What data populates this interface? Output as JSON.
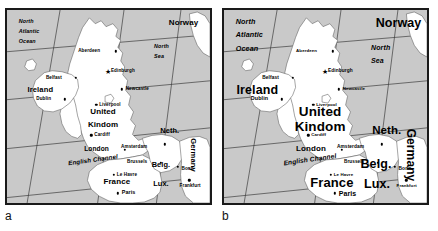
{
  "figure": {
    "panels": [
      {
        "id": "a",
        "caption": "a",
        "label_scale": "small",
        "oceans": [
          {
            "name": "north-atlantic-ocean",
            "text_lines": [
              "North",
              "Atlantic",
              "Ocean"
            ],
            "x": 12,
            "y": 12,
            "size": 5.4
          },
          {
            "name": "north-sea",
            "text_lines": [
              "North",
              "Sea"
            ],
            "x": 150,
            "y": 38,
            "size": 5.4
          }
        ],
        "countries": [
          {
            "name": "ireland",
            "label": "Ireland",
            "x": 34,
            "y": 82,
            "size": 7.6
          },
          {
            "name": "united-kingdom",
            "label": "United",
            "x": 98,
            "y": 104,
            "size": 8.0
          },
          {
            "name": "united-kingdom-2",
            "label": "Kindom",
            "x": 98,
            "y": 117,
            "size": 8.0
          },
          {
            "name": "norway",
            "label": "Norway",
            "x": 180,
            "y": 13,
            "size": 8.0
          },
          {
            "name": "netherlands",
            "label": "Neth.",
            "x": 166,
            "y": 124,
            "size": 7.4
          },
          {
            "name": "belgium",
            "label": "Belg.",
            "x": 157,
            "y": 158,
            "size": 7.4
          },
          {
            "name": "luxembourg",
            "label": "Lux.",
            "x": 157,
            "y": 178,
            "size": 7.4
          },
          {
            "name": "france",
            "label": "France",
            "x": 112,
            "y": 176,
            "size": 8.0
          },
          {
            "name": "germany",
            "label": "Germany",
            "x": 190,
            "y": 148,
            "size": 7.6,
            "vertical": true
          }
        ],
        "seas": [
          {
            "name": "english-channel",
            "label": "English Channel",
            "x": 88,
            "y": 153,
            "size": 6.2,
            "rotate": -8
          }
        ],
        "cities": [
          {
            "name": "aberdeen",
            "label": "Aberdeen",
            "lx": 95,
            "ly": 42,
            "dx": 111,
            "dy": 42,
            "size": 4.6,
            "anchor": "right"
          },
          {
            "name": "edinburgh",
            "label": "Edinburgh",
            "lx": 106,
            "ly": 62,
            "dx": 103,
            "dy": 62,
            "size": 4.6,
            "anchor": "left",
            "marker": "star"
          },
          {
            "name": "newcastle",
            "label": "Newcastle",
            "lx": 121,
            "ly": 81,
            "dx": 117,
            "dy": 81,
            "size": 4.6,
            "anchor": "left"
          },
          {
            "name": "belfast",
            "label": "Belfast",
            "lx": 56,
            "ly": 69,
            "dx": 70,
            "dy": 69,
            "size": 4.6,
            "anchor": "right"
          },
          {
            "name": "dublin",
            "label": "Dublin",
            "lx": 45,
            "ly": 91,
            "dx": 59,
            "dy": 91,
            "size": 4.6,
            "anchor": "right"
          },
          {
            "name": "liverpool",
            "label": "Liverpool",
            "lx": 94,
            "ly": 97,
            "dx": 91,
            "dy": 97,
            "size": 4.6,
            "anchor": "left"
          },
          {
            "name": "cardiff",
            "label": "Cardiff",
            "lx": 89,
            "ly": 128,
            "dx": 86,
            "dy": 128,
            "size": 4.6,
            "anchor": "left"
          },
          {
            "name": "london",
            "label": "London",
            "lx": 104,
            "ly": 142,
            "dx": 120,
            "dy": 143,
            "size": 6.6,
            "anchor": "right"
          },
          {
            "name": "amsterdam",
            "label": "Amsterdam",
            "lx": 143,
            "ly": 140,
            "dx": 161,
            "dy": 137,
            "size": 4.6,
            "anchor": "right"
          },
          {
            "name": "brussels",
            "label": "Brussels",
            "lx": 143,
            "ly": 155,
            "dx": 157,
            "dy": 156,
            "size": 4.6,
            "anchor": "right"
          },
          {
            "name": "le-havre",
            "label": "Le Havre",
            "lx": 112,
            "ly": 168,
            "dx": 109,
            "dy": 168,
            "size": 4.6,
            "anchor": "left"
          },
          {
            "name": "paris",
            "label": "Paris",
            "lx": 117,
            "ly": 187,
            "dx": 113,
            "dy": 187,
            "size": 5.4,
            "anchor": "left"
          },
          {
            "name": "bonn",
            "label": "Bonn",
            "lx": 178,
            "ly": 162,
            "dx": 174,
            "dy": 160,
            "size": 4.6,
            "anchor": "left"
          },
          {
            "name": "frankfurt",
            "label": "Frankfurt",
            "lx": 176,
            "ly": 180,
            "dx": 186,
            "dy": 174,
            "size": 4.6,
            "anchor": "left"
          }
        ]
      },
      {
        "id": "b",
        "caption": "b",
        "label_scale": "large",
        "oceans": [
          {
            "name": "north-atlantic-ocean",
            "text_lines": [
              "North",
              "Atlantic",
              "Ocean"
            ],
            "x": 12,
            "y": 12,
            "size": 7.2
          },
          {
            "name": "north-sea",
            "text_lines": [
              "North",
              "Sea"
            ],
            "x": 150,
            "y": 38,
            "size": 7.0
          }
        ],
        "countries": [
          {
            "name": "ireland",
            "label": "Ireland",
            "x": 34,
            "y": 82,
            "size": 12.5
          },
          {
            "name": "united-kingdom",
            "label": "United",
            "x": 98,
            "y": 104,
            "size": 13.5
          },
          {
            "name": "united-kingdom-2",
            "label": "Kindom",
            "x": 98,
            "y": 119,
            "size": 13.5
          },
          {
            "name": "norway",
            "label": "Norway",
            "x": 178,
            "y": 13,
            "size": 12.5
          },
          {
            "name": "netherlands",
            "label": "Neth.",
            "x": 166,
            "y": 124,
            "size": 11.5
          },
          {
            "name": "belgium",
            "label": "Belg.",
            "x": 155,
            "y": 157,
            "size": 12.5
          },
          {
            "name": "luxembourg",
            "label": "Lux.",
            "x": 156,
            "y": 178,
            "size": 12.5
          },
          {
            "name": "france",
            "label": "France",
            "x": 110,
            "y": 176,
            "size": 13.0
          },
          {
            "name": "germany",
            "label": "Germany",
            "x": 191,
            "y": 148,
            "size": 12.0,
            "vertical": true
          }
        ],
        "seas": [
          {
            "name": "english-channel",
            "label": "English Channel",
            "x": 88,
            "y": 153,
            "size": 6.6,
            "rotate": -8
          }
        ],
        "cities": [
          {
            "name": "aberdeen",
            "label": "Aberdeen",
            "lx": 95,
            "ly": 42,
            "dx": 111,
            "dy": 42,
            "size": 4.4,
            "anchor": "right"
          },
          {
            "name": "edinburgh",
            "label": "Edinburgh",
            "lx": 106,
            "ly": 62,
            "dx": 103,
            "dy": 62,
            "size": 4.8,
            "anchor": "left",
            "marker": "star"
          },
          {
            "name": "newcastle",
            "label": "Newcastle",
            "lx": 121,
            "ly": 81,
            "dx": 117,
            "dy": 81,
            "size": 4.4,
            "anchor": "left"
          },
          {
            "name": "belfast",
            "label": "Belfast",
            "lx": 56,
            "ly": 69,
            "dx": 70,
            "dy": 69,
            "size": 4.8,
            "anchor": "right"
          },
          {
            "name": "dublin",
            "label": "Dublin",
            "lx": 45,
            "ly": 91,
            "dx": 59,
            "dy": 91,
            "size": 5.4,
            "anchor": "right"
          },
          {
            "name": "liverpool",
            "label": "Liverpool",
            "lx": 94,
            "ly": 97,
            "dx": 91,
            "dy": 97,
            "size": 4.4,
            "anchor": "left"
          },
          {
            "name": "cardiff",
            "label": "Cardiff",
            "lx": 89,
            "ly": 128,
            "dx": 86,
            "dy": 128,
            "size": 4.4,
            "anchor": "left"
          },
          {
            "name": "london",
            "label": "London",
            "lx": 104,
            "ly": 142,
            "dx": 120,
            "dy": 143,
            "size": 8.0,
            "anchor": "right"
          },
          {
            "name": "amsterdam",
            "label": "Amsterdam",
            "lx": 143,
            "ly": 140,
            "dx": 161,
            "dy": 137,
            "size": 4.8,
            "anchor": "right"
          },
          {
            "name": "brussels",
            "label": "Brussels",
            "lx": 143,
            "ly": 155,
            "dx": 157,
            "dy": 156,
            "size": 4.6,
            "anchor": "right"
          },
          {
            "name": "le-havre",
            "label": "Le Havre",
            "lx": 112,
            "ly": 168,
            "dx": 109,
            "dy": 168,
            "size": 4.4,
            "anchor": "left"
          },
          {
            "name": "paris",
            "label": "Paris",
            "lx": 117,
            "ly": 187,
            "dx": 113,
            "dy": 187,
            "size": 7.0,
            "anchor": "left"
          },
          {
            "name": "bonn",
            "label": "Bonn",
            "lx": 178,
            "ly": 162,
            "dx": 174,
            "dy": 160,
            "size": 4.8,
            "anchor": "left"
          },
          {
            "name": "frankfurt",
            "label": "Frankfurt",
            "lx": 176,
            "ly": 180,
            "dx": 186,
            "dy": 174,
            "size": 4.4,
            "anchor": "left"
          }
        ]
      }
    ]
  },
  "style": {
    "sea_color": "#c9c9c9",
    "land_color": "#ffffff",
    "border_color": "#1a1a1a",
    "graticule_color": "#3a3a3a",
    "coast_color": "#555555",
    "text_color": "#000000"
  }
}
